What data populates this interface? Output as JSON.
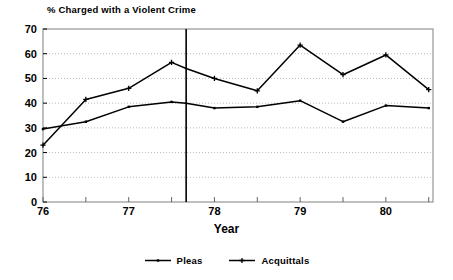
{
  "chart_data": {
    "type": "line",
    "title": "% Charged with a Violent Crime",
    "xlabel": "Year",
    "ylabel": "",
    "xlim": [
      76.0,
      80.55
    ],
    "ylim": [
      0,
      70
    ],
    "yticks": [
      0,
      10,
      20,
      30,
      40,
      50,
      60,
      70
    ],
    "ytick_labels": [
      "0",
      "10",
      "20",
      "30",
      "40",
      "50",
      "60",
      "70"
    ],
    "xticks": [
      76,
      77,
      78,
      79,
      80
    ],
    "xtick_labels": [
      "76",
      "77",
      "78",
      "79",
      "80"
    ],
    "x_minor_ticks": [
      76.5,
      77.5,
      78.5,
      79.5,
      80.5
    ],
    "grid": "horizontal-dotted",
    "legend_position": "bottom-center",
    "annotations": [
      {
        "name": "policy-change-marker",
        "type": "vertical-line",
        "x": 77.67,
        "style": "solid"
      }
    ],
    "x": [
      76.0,
      76.5,
      77.0,
      77.5,
      77.67,
      78.0,
      78.5,
      79.0,
      79.5,
      80.0,
      80.5
    ],
    "series": [
      {
        "name": "Pleas",
        "marker": "dot",
        "color": "#000000",
        "values": [
          29.5,
          32.5,
          38.5,
          40.5,
          40.0,
          38.0,
          38.5,
          41.0,
          32.5,
          39.0,
          38.0
        ]
      },
      {
        "name": "Acquittals",
        "marker": "cross",
        "color": "#000000",
        "values": [
          23.0,
          41.5,
          46.0,
          56.5,
          54.0,
          50.0,
          45.0,
          63.5,
          51.5,
          59.5,
          45.5
        ]
      }
    ]
  },
  "legend": {
    "items": [
      {
        "label": "Pleas",
        "marker": "dot"
      },
      {
        "label": "Acquittals",
        "marker": "cross"
      }
    ]
  }
}
